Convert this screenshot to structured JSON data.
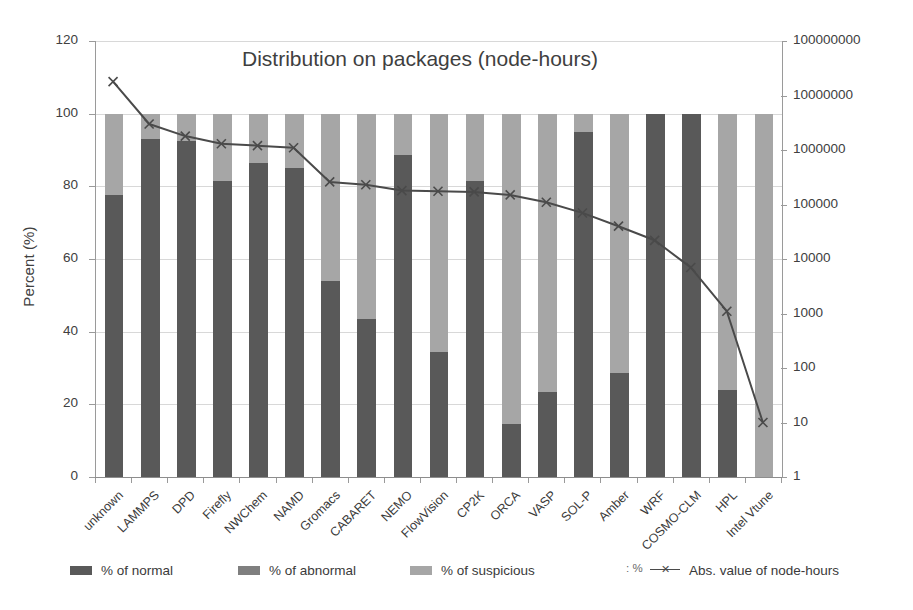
{
  "chart_data": {
    "type": "bar",
    "title": "Distribution on packages (node-hours)",
    "xlabel": "",
    "ylabel": "Percent (%)",
    "y2label": "Absolute value of node-hours",
    "ylim": [
      0,
      120
    ],
    "yticks": [
      0,
      20,
      40,
      60,
      80,
      100,
      120
    ],
    "y2lim": [
      1,
      100000000
    ],
    "y2scale": "log",
    "y2ticks": [
      1,
      10,
      100,
      1000,
      10000,
      100000,
      1000000,
      10000000,
      100000000
    ],
    "grid": true,
    "legend_position": "bottom",
    "stacked": true,
    "categories": [
      "unknown",
      "LAMMPS",
      "DPD",
      "Firefly",
      "NWChem",
      "NAMD",
      "Gromacs",
      "CABARET",
      "NEMO",
      "FlowVision",
      "CP2K",
      "ORCA",
      "VASP",
      "SOL-P",
      "Amber",
      "WRF",
      "COSMO-CLM",
      "HPL",
      "Intel Vtune"
    ],
    "series": [
      {
        "name": "% of normal",
        "color": "#595959",
        "values": [
          77.5,
          93.0,
          92.5,
          81.5,
          86.5,
          85.0,
          54.0,
          43.5,
          88.5,
          34.5,
          81.5,
          14.5,
          23.5,
          95.0,
          28.5,
          100.0,
          100.0,
          24.0,
          0.0
        ]
      },
      {
        "name": "% of abnormal",
        "color": "#7f7f7f",
        "values": [
          0,
          0,
          0,
          0,
          0,
          0,
          0,
          0,
          0,
          0,
          0,
          0,
          0,
          0,
          0,
          0,
          0,
          0,
          0
        ]
      },
      {
        "name": "% of suspicious",
        "color": "#a6a6a6",
        "values": [
          22.5,
          7.0,
          7.5,
          18.5,
          13.5,
          15.0,
          46.0,
          56.5,
          11.5,
          65.5,
          18.5,
          85.5,
          76.5,
          5.0,
          71.5,
          0.0,
          0.0,
          76.0,
          100.0
        ]
      }
    ],
    "line_series": {
      "name": "Abs. value of node-hours",
      "color": "#4a4a4a",
      "marker": "x",
      "values": [
        18000000,
        3000000,
        1800000,
        1300000,
        1200000,
        1100000,
        260000,
        230000,
        180000,
        175000,
        170000,
        150000,
        110000,
        70000,
        40000,
        22000,
        7000,
        1100,
        10
      ]
    },
    "legend": [
      {
        "label": "% of normal",
        "type": "swatch",
        "color": "#595959"
      },
      {
        "label": "% of abnormal",
        "type": "swatch",
        "color": "#7f7f7f"
      },
      {
        "label": "% of suspicious",
        "type": "swatch",
        "color": "#a6a6a6"
      },
      {
        "label": "Abs. value of node-hours",
        "type": "line",
        "color": "#4a4a4a"
      }
    ],
    "legend_stray_text": ": %"
  },
  "colors": {
    "normal": "#595959",
    "abnormal": "#7f7f7f",
    "suspicious": "#a6a6a6",
    "line": "#4a4a4a",
    "grid": "#d8d8d8",
    "axis": "#9a9a9a",
    "text": "#3a3a3a",
    "background": "#ffffff"
  }
}
